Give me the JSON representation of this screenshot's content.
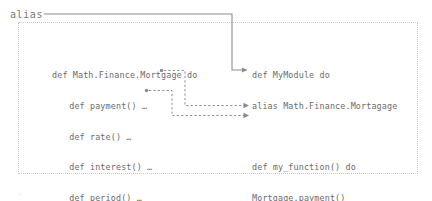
{
  "diagram": {
    "title_label": "alias",
    "frame_name": "module-scope-frame"
  },
  "left_block": {
    "name": "mortgage-module-definition",
    "lines": [
      {
        "text": "def Math.Finance.Mortgage do",
        "indent": 0
      },
      {
        "text": "def payment() …",
        "indent": 1
      },
      {
        "text": "def rate() …",
        "indent": 1
      },
      {
        "text": "def interest() …",
        "indent": 1
      },
      {
        "text": "def period() …",
        "indent": 1
      },
      {
        "text": "end",
        "indent": 0
      }
    ]
  },
  "right_block": {
    "name": "mymodule-definition",
    "lines": [
      {
        "text": "def MyModule do",
        "indent": 0
      },
      {
        "text": "alias Math.Finance.Mortagage",
        "indent": 0
      },
      {
        "text": "",
        "indent": 0
      },
      {
        "text": "def my_function() do",
        "indent": 0
      },
      {
        "text": "Mortgage.payment()",
        "indent": 0
      },
      {
        "text": "Mortgage.interest()",
        "indent": 0
      },
      {
        "text": "end",
        "indent": 0
      },
      {
        "text": "end",
        "indent": 0
      }
    ]
  },
  "connectors": [
    {
      "name": "alias-connector",
      "from": "alias-label",
      "to": "alias-statement",
      "style": "solid"
    },
    {
      "name": "payment-connector",
      "from": "def payment()",
      "to": "Mortgage.payment()",
      "style": "dashed"
    },
    {
      "name": "interest-connector",
      "from": "def interest()",
      "to": "Mortgage.interest()",
      "style": "dashed"
    }
  ],
  "colors": {
    "text": "#6b6b6b",
    "line": "#8d8d8d",
    "frame": "#c9c9c9",
    "background": "#ffffff"
  }
}
